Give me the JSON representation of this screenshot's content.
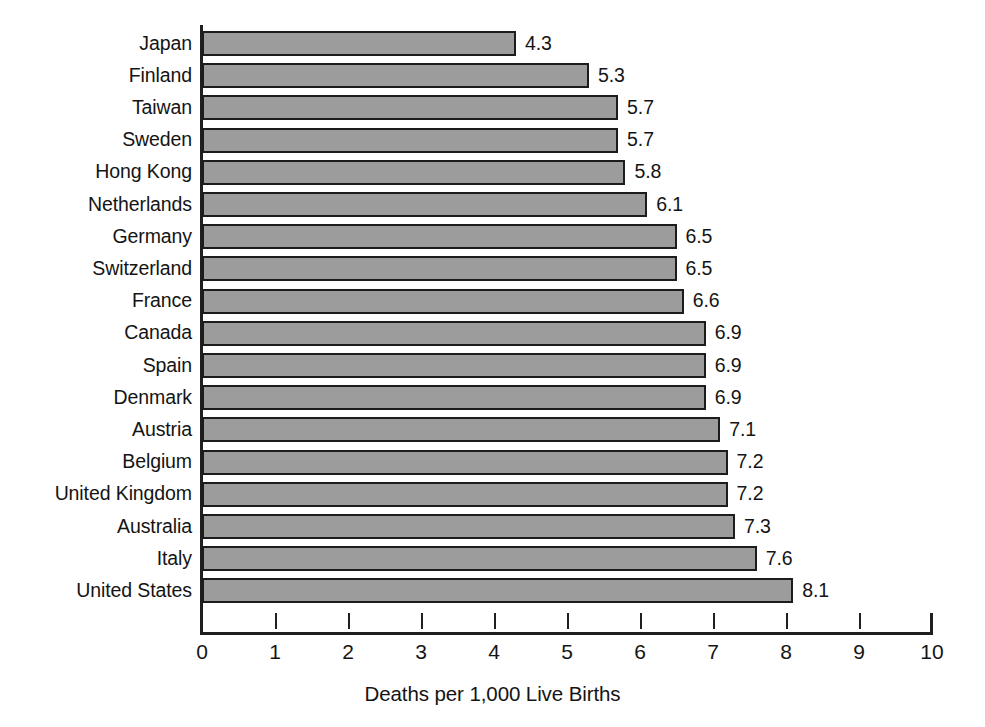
{
  "chart_data": {
    "type": "bar",
    "orientation": "horizontal",
    "title": "",
    "subtitle": "",
    "xlabel": "Deaths per 1,000 Live Births",
    "ylabel": "",
    "xlim": [
      0,
      10
    ],
    "xticks": [
      "0",
      "1",
      "2",
      "3",
      "4",
      "5",
      "6",
      "7",
      "8",
      "9",
      "10"
    ],
    "grid": false,
    "legend": null,
    "legend_position": "none",
    "bar_color": "#9c9c9c",
    "bar_border_color": "#1c1c1c",
    "axis_color": "#1f1f1f",
    "background_color": "#ffffff",
    "categories": [
      "Japan",
      "Finland",
      "Taiwan",
      "Sweden",
      "Hong Kong",
      "Netherlands",
      "Germany",
      "Switzerland",
      "France",
      "Canada",
      "Spain",
      "Denmark",
      "Austria",
      "Belgium",
      "United Kingdom",
      "Australia",
      "Italy",
      "United States"
    ],
    "values": [
      4.3,
      5.3,
      5.7,
      5.7,
      5.8,
      6.1,
      6.5,
      6.5,
      6.6,
      6.9,
      6.9,
      6.9,
      7.1,
      7.2,
      7.2,
      7.3,
      7.6,
      8.1
    ],
    "value_labels": [
      "4.3",
      "5.3",
      "5.7",
      "5.7",
      "5.8",
      "6.1",
      "6.5",
      "6.5",
      "6.6",
      "6.9",
      "6.9",
      "6.9",
      "7.1",
      "7.2",
      "7.2",
      "7.3",
      "7.6",
      "8.1"
    ]
  }
}
